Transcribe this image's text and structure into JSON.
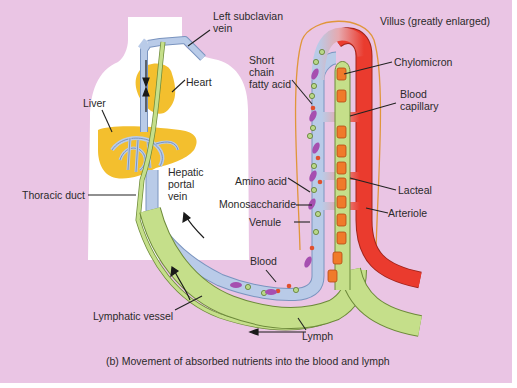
{
  "figure": {
    "caption": "(b) Movement of absorbed nutrients into the blood and lymph",
    "colors": {
      "background": "#eac5e4",
      "body": "#ffffff",
      "organ": "#f3bf2e",
      "vein": "#b9cbe8",
      "lymph": "#c5df8a",
      "artery": "#ea3b2e",
      "chylomicron": "#f07a2a",
      "monosaccharide": "#b8d889",
      "amino_acid": "#e0502e",
      "fatty_acid": "#a64fb0",
      "villus_outline": "#e0963a"
    }
  },
  "labels": {
    "left_subclavian_vein_1": "Left subclavian",
    "left_subclavian_vein_2": "vein",
    "heart": "Heart",
    "liver": "Liver",
    "hepatic_portal_vein_1": "Hepatic",
    "hepatic_portal_vein_2": "portal",
    "hepatic_portal_vein_3": "vein",
    "thoracic_duct": "Thoracic duct",
    "lymphatic_vessel": "Lymphatic vessel",
    "villus": "Villus (greatly enlarged)",
    "short_chain_fatty_acid_1": "Short",
    "short_chain_fatty_acid_2": "chain",
    "short_chain_fatty_acid_3": "fatty acid",
    "chylomicron": "Chylomicron",
    "blood_capillary_1": "Blood",
    "blood_capillary_2": "capillary",
    "amino_acid": "Amino acid",
    "monosaccharide": "Monosaccharide",
    "venule": "Venule",
    "lacteal": "Lacteal",
    "arteriole": "Arteriole",
    "blood": "Blood",
    "lymph": "Lymph"
  }
}
